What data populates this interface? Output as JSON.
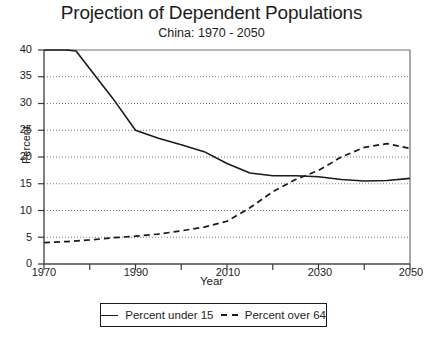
{
  "chart_data": {
    "type": "line",
    "title": "Projection of Dependent Populations",
    "subtitle": "China: 1970 - 2050",
    "xlabel": "Year",
    "ylabel": "Percent",
    "xlim": [
      1970,
      2050
    ],
    "ylim": [
      0,
      40
    ],
    "ytick_labels": [
      "0",
      "5",
      "10",
      "15",
      "20",
      "25",
      "30",
      "35",
      "40"
    ],
    "ytick_values": [
      0,
      5,
      10,
      15,
      20,
      25,
      30,
      35,
      40
    ],
    "xtick_labels": [
      "1970",
      "1990",
      "2010",
      "2030",
      "2050"
    ],
    "xtick_values": [
      1970,
      1990,
      2010,
      2030,
      2050
    ],
    "xminor_values": [
      1980,
      2000,
      2020,
      2040
    ],
    "grid": "horizontal-dotted",
    "legend_position": "below-plot",
    "series": [
      {
        "name": "Percent under 15",
        "style": "solid",
        "color": "#1a1a1a",
        "x": [
          1970,
          1975,
          1977,
          1980,
          1985,
          1990,
          1995,
          2000,
          2005,
          2010,
          2015,
          2020,
          2025,
          2030,
          2035,
          2040,
          2045,
          2050
        ],
        "values": [
          40.0,
          40.0,
          39.8,
          36.5,
          31.0,
          25.0,
          23.5,
          22.3,
          21.0,
          18.8,
          17.0,
          16.5,
          16.5,
          16.3,
          15.8,
          15.5,
          15.6,
          16.0
        ]
      },
      {
        "name": "Percent over 64",
        "style": "dashed",
        "color": "#1a1a1a",
        "x": [
          1970,
          1975,
          1980,
          1985,
          1990,
          1995,
          2000,
          2005,
          2010,
          2015,
          2020,
          2025,
          2030,
          2035,
          2040,
          2045,
          2050
        ],
        "values": [
          4.0,
          4.2,
          4.5,
          4.9,
          5.2,
          5.6,
          6.2,
          6.9,
          8.0,
          10.5,
          13.5,
          15.8,
          17.5,
          20.0,
          21.8,
          22.5,
          21.6
        ]
      }
    ]
  },
  "legend": {
    "series_1_label": "Percent under 15",
    "series_2_label": "Percent over 64"
  }
}
